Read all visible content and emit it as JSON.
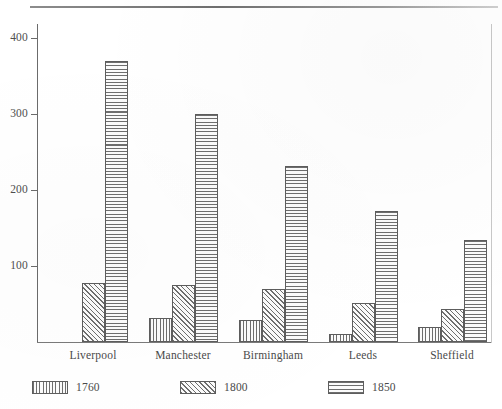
{
  "chart_data": {
    "type": "bar",
    "title": "",
    "subtitle": "",
    "xlabel": "",
    "ylabel": "",
    "categories": [
      "Liverpool",
      "Manchester",
      "Birmingham",
      "Leeds",
      "Sheffield"
    ],
    "series": [
      {
        "name": "1760",
        "pattern": "vertical-lines",
        "values": [
          0,
          32,
          29,
          11,
          20
        ]
      },
      {
        "name": "1800",
        "pattern": "diagonal-hatch",
        "values": [
          78,
          75,
          70,
          51,
          43
        ]
      },
      {
        "name": "1850",
        "pattern": "horizontal-lines",
        "values": [
          370,
          300,
          232,
          172,
          134
        ]
      }
    ],
    "ylim": [
      0,
      430
    ],
    "yticks": [
      100,
      200,
      300,
      400
    ],
    "ytick_labels": [
      "100",
      "200",
      "300",
      "400"
    ],
    "grid": false,
    "legend_position": "bottom",
    "legend_entries": [
      "1760",
      "1800",
      "1850"
    ],
    "colors": {
      "axis": "#6b6b6b",
      "bar_outline": "#5d5d5d",
      "bar_fill": "#fbfbfb",
      "hatch": "#6e6e6e",
      "text": "#4a4a4a",
      "background": "#ffffff"
    }
  }
}
